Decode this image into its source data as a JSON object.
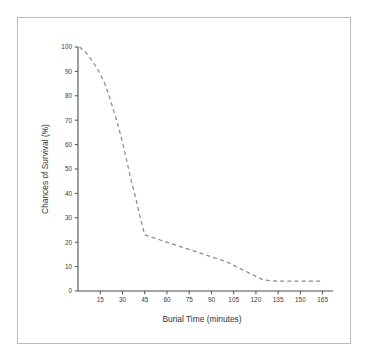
{
  "figure": {
    "background_color": "#ffffff",
    "frame_color": "#b9b9b9",
    "axis_color": "#4d4d4d",
    "series_color": "#8c8c8c"
  },
  "chart_data": {
    "type": "line",
    "title": "",
    "subtitle": "",
    "xlabel": "Burial Time (minutes)",
    "ylabel": "Chances of Survival (%)",
    "xlim": [
      0,
      172
    ],
    "ylim": [
      0,
      100
    ],
    "grid": false,
    "legend": null,
    "legend_position": "none",
    "line_style": "dashed",
    "xticks": [
      15,
      30,
      45,
      60,
      75,
      90,
      105,
      120,
      135,
      150,
      165
    ],
    "xtick_labels": [
      "15",
      "30",
      "45",
      "60",
      "75",
      "90",
      "105",
      "120",
      "135",
      "150",
      "165"
    ],
    "yticks": [
      0,
      10,
      20,
      30,
      40,
      50,
      60,
      70,
      80,
      90,
      100
    ],
    "ytick_labels": [
      "0",
      "10",
      "20",
      "30",
      "40",
      "50",
      "60",
      "70",
      "80",
      "90",
      "100"
    ],
    "series": [
      {
        "name": "Chances of Survival",
        "color": "#8c8c8c",
        "x": [
          1,
          5,
          10,
          15,
          18,
          21,
          24,
          27,
          30,
          33,
          36,
          39,
          42,
          45,
          50,
          55,
          60,
          70,
          80,
          90,
          100,
          110,
          120,
          125,
          135,
          145,
          155,
          165
        ],
        "y": [
          100,
          98,
          94,
          89,
          85,
          80,
          74,
          68,
          61,
          53,
          45,
          38,
          30,
          23,
          22,
          21,
          20,
          18,
          16,
          14,
          12,
          9,
          6,
          4.5,
          4,
          4,
          4,
          4
        ]
      }
    ],
    "annotations": []
  }
}
